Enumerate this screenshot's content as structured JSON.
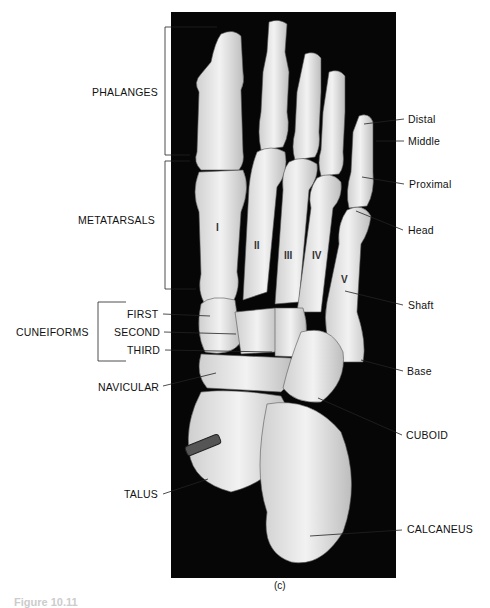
{
  "figure": {
    "panel_label": "(c)",
    "caption_partial": "Figure 10.11"
  },
  "groups": {
    "phalanges": "PHALANGES",
    "metatarsals": "METATARSALS",
    "cuneiforms": "CUNEIFORMS"
  },
  "left_labels": {
    "first": "FIRST",
    "second": "SECOND",
    "third": "THIRD",
    "navicular": "NAVICULAR",
    "talus": "TALUS"
  },
  "right_labels": {
    "distal": "Distal",
    "middle": "Middle",
    "proximal": "Proximal",
    "head": "Head",
    "shaft": "Shaft",
    "base": "Base",
    "cuboid": "CUBOID",
    "calcaneus": "CALCANEUS"
  },
  "metatarsal_numerals": [
    "I",
    "II",
    "III",
    "IV",
    "V"
  ]
}
